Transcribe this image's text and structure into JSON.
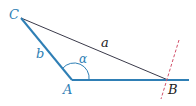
{
  "diagram": {
    "type": "triangle",
    "colors": {
      "blue": "#2f7fb5",
      "dark": "#3a3a4a",
      "red_dashed": "#d2506a",
      "label_blue": "#2f7fb5",
      "label_dark": "#222222"
    },
    "vertices": {
      "C": {
        "label": "C",
        "x": 21,
        "y": 18
      },
      "A": {
        "label": "A",
        "x": 72,
        "y": 80
      },
      "B": {
        "label": "B",
        "x": 168,
        "y": 80
      }
    },
    "sides": {
      "a": {
        "label": "a",
        "from": "C",
        "to": "B"
      },
      "b": {
        "label": "b",
        "from": "C",
        "to": "A"
      }
    },
    "angle": {
      "label": "α",
      "vertex": "A"
    }
  }
}
